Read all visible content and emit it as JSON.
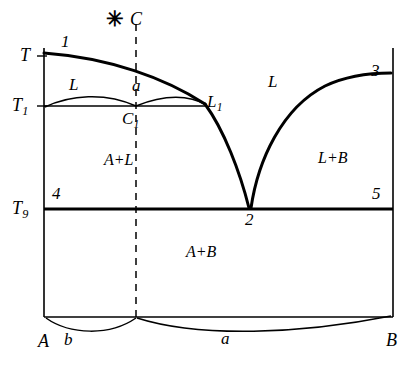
{
  "figure": {
    "type": "phase-diagram",
    "width": 418,
    "height": 367,
    "background_color": "#ffffff",
    "line_color": "#000000"
  },
  "axes": {
    "y_axis_label": "T",
    "y_ticks": [
      {
        "id": "T",
        "label": "T",
        "sub": "",
        "y": 56
      },
      {
        "id": "T1",
        "label": "T",
        "sub": "1",
        "y": 106
      },
      {
        "id": "T9",
        "label": "T",
        "sub": "9",
        "y": 209
      }
    ],
    "x_endpoints": [
      {
        "id": "A",
        "label": "A",
        "x": 44
      },
      {
        "id": "B",
        "label": "B",
        "x": 393
      }
    ]
  },
  "points": [
    {
      "id": "1",
      "label": "1",
      "x": 66,
      "y": 42
    },
    {
      "id": "2",
      "label": "2",
      "x": 250,
      "y": 222
    },
    {
      "id": "3",
      "label": "3",
      "x": 376,
      "y": 73
    },
    {
      "id": "4",
      "label": "4",
      "x": 56,
      "y": 195
    },
    {
      "id": "5",
      "label": "5",
      "x": 376,
      "y": 195
    },
    {
      "id": "C",
      "label": "C",
      "x": 135,
      "y": 18
    },
    {
      "id": "C1",
      "label": "C",
      "sub": "1",
      "x": 128,
      "y": 120
    },
    {
      "id": "L1",
      "label": "L",
      "sub": "1",
      "x": 210,
      "y": 101
    }
  ],
  "markers": [
    {
      "id": "composition-star",
      "glyph": "✳",
      "x": 110,
      "y": 14
    }
  ],
  "regions": [
    {
      "id": "liquid-left",
      "label": "L",
      "x": 74,
      "y": 85
    },
    {
      "id": "alpha",
      "label": "a",
      "x": 137,
      "y": 85
    },
    {
      "id": "liquid-right",
      "label": "L",
      "x": 273,
      "y": 82
    },
    {
      "id": "A-plus-L",
      "label": "A+L",
      "x": 107,
      "y": 160
    },
    {
      "id": "L-plus-B",
      "label": "L+B",
      "x": 325,
      "y": 158
    },
    {
      "id": "A-plus-B",
      "label": "A+B",
      "x": 189,
      "y": 250
    },
    {
      "id": "beta-bottom",
      "label": "b",
      "x": 68,
      "y": 338
    },
    {
      "id": "alpha-bottom",
      "label": "a",
      "x": 225,
      "y": 336
    }
  ],
  "geometry": {
    "left_axis_x": 44,
    "right_axis_x": 393,
    "top_y": 48,
    "solidus_y": 209,
    "bottom_y": 317,
    "dashed_line_x": 136,
    "eutectic_x": 250
  }
}
